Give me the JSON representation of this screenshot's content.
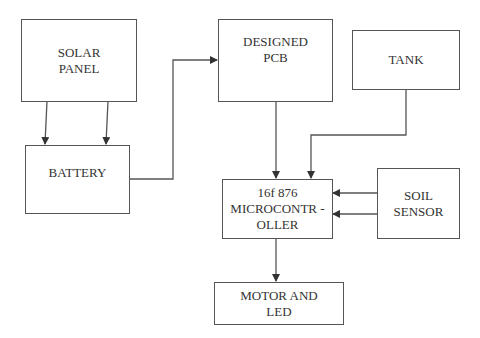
{
  "diagram": {
    "type": "block-diagram",
    "blocks": [
      {
        "id": "solar_panel",
        "label": "SOLAR\nPANEL"
      },
      {
        "id": "battery",
        "label": "BATTERY"
      },
      {
        "id": "designed_pcb",
        "label": "DESIGNED\nPCB"
      },
      {
        "id": "tank",
        "label": "TANK"
      },
      {
        "id": "microcontroller",
        "label": "16f 876\nMICROCONTR -\nOLLER"
      },
      {
        "id": "soil_sensor",
        "label": "SOIL\nSENSOR"
      },
      {
        "id": "motor_led",
        "label": "MOTOR AND\nLED"
      }
    ],
    "connections": [
      {
        "from": "solar_panel",
        "to": "battery",
        "count": 2
      },
      {
        "from": "battery",
        "to": "designed_pcb"
      },
      {
        "from": "designed_pcb",
        "to": "microcontroller"
      },
      {
        "from": "tank",
        "to": "microcontroller"
      },
      {
        "from": "soil_sensor",
        "to": "microcontroller",
        "count": 2
      },
      {
        "from": "microcontroller",
        "to": "motor_led"
      }
    ],
    "colors": {
      "line": "#555555",
      "text": "#333333",
      "background": "#ffffff"
    }
  }
}
